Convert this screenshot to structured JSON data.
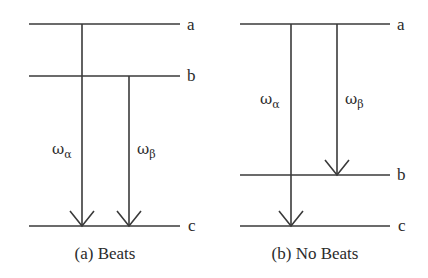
{
  "figure": {
    "panels": [
      {
        "id": "a",
        "caption": "(a) Beats",
        "levels": [
          {
            "name": "a",
            "label": "a"
          },
          {
            "name": "b",
            "label": "b"
          },
          {
            "name": "c",
            "label": "c"
          }
        ],
        "transitions": [
          {
            "symbol": "ω",
            "subscript": "α",
            "from": "a",
            "to": "c"
          },
          {
            "symbol": "ω",
            "subscript": "β",
            "from": "b",
            "to": "c"
          }
        ]
      },
      {
        "id": "b",
        "caption": "(b) No Beats",
        "levels": [
          {
            "name": "a",
            "label": "a"
          },
          {
            "name": "b",
            "label": "b"
          },
          {
            "name": "c",
            "label": "c"
          }
        ],
        "transitions": [
          {
            "symbol": "ω",
            "subscript": "α",
            "from": "a",
            "to": "c"
          },
          {
            "symbol": "ω",
            "subscript": "β",
            "from": "a",
            "to": "b"
          }
        ]
      }
    ],
    "colors": {
      "line": "#3a3a3a",
      "text": "#2b2b2b",
      "background": "#ffffff"
    }
  }
}
